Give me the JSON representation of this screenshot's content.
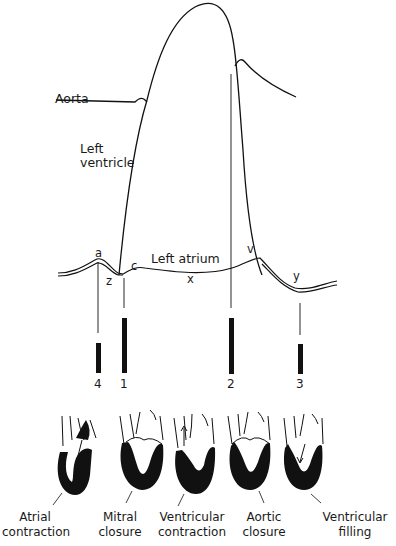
{
  "traces": {
    "aorta": "Aorta",
    "left_ventricle_line1": "Left",
    "left_ventricle_line2": "ventricle",
    "left_atrium": "Left atrium"
  },
  "wave_points": {
    "a": "a",
    "c": "c",
    "v": "v",
    "x": "x",
    "y": "y",
    "z": "z"
  },
  "markers": [
    {
      "id": "4",
      "label": "4"
    },
    {
      "id": "1",
      "label": "1"
    },
    {
      "id": "2",
      "label": "2"
    },
    {
      "id": "3",
      "label": "3"
    }
  ],
  "heart_phases": [
    {
      "line1": "Atrial",
      "line2": "contraction"
    },
    {
      "line1": "Mitral",
      "line2": "closure"
    },
    {
      "line1": "Ventricular",
      "line2": "contraction"
    },
    {
      "line1": "Aortic",
      "line2": "closure"
    },
    {
      "line1": "Ventricular",
      "line2": "filling"
    }
  ],
  "colors": {
    "ink": "#111111",
    "background": "#ffffff"
  }
}
